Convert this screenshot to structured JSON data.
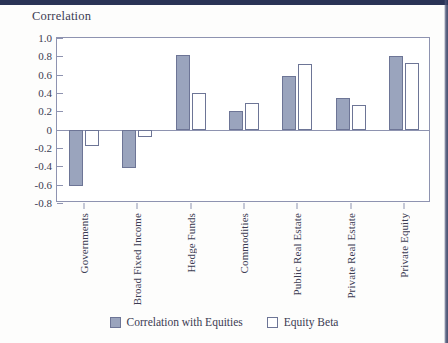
{
  "page": {
    "background_color": "#fdfdfc",
    "scan_band_color": "#2a3356"
  },
  "chart_data": {
    "type": "bar",
    "title": "Correlation",
    "xlabel": "",
    "ylabel": "Correlation",
    "ylim": [
      -0.8,
      1.0
    ],
    "ytick_labels": [
      "1.0",
      "0.8",
      "0.6",
      "0.4",
      "0.2",
      "0",
      "-0.2",
      "-0.4",
      "-0.6",
      "-0.8"
    ],
    "ytick_values": [
      1.0,
      0.8,
      0.6,
      0.4,
      0.2,
      0,
      -0.2,
      -0.4,
      -0.6,
      -0.8
    ],
    "grid": false,
    "legend_position": "bottom",
    "categories": [
      "Governments",
      "Broad Fixed Income",
      "Hedge Funds",
      "Commodities",
      "Public Real Estate",
      "Private Real Estate",
      "Private Equity"
    ],
    "series": [
      {
        "name": "Correlation with Equities",
        "style": "filled",
        "color": "#9aa4bd",
        "border_color": "#6d7596",
        "values": [
          -0.61,
          -0.42,
          0.82,
          0.2,
          0.59,
          0.35,
          0.8
        ]
      },
      {
        "name": "Equity Beta",
        "style": "hollow",
        "color": "#ffffff",
        "border_color": "#6d7596",
        "values": [
          -0.18,
          -0.08,
          0.4,
          0.29,
          0.72,
          0.27,
          0.73
        ]
      }
    ]
  },
  "legend": {
    "items": [
      {
        "label": "Correlation with Equities",
        "style": "filled"
      },
      {
        "label": "Equity Beta",
        "style": "hollow"
      }
    ]
  }
}
